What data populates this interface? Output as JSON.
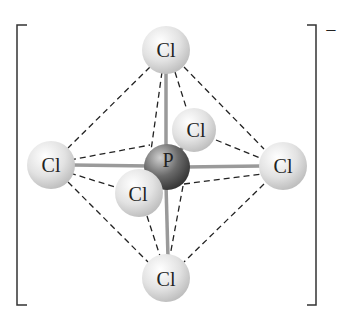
{
  "diagram": {
    "type": "molecular-structure",
    "charge": "−",
    "central_atom": {
      "symbol": "P",
      "x": 167,
      "y": 167
    },
    "ligands": [
      {
        "symbol": "Cl",
        "position": "top",
        "x": 166,
        "y": 50
      },
      {
        "symbol": "Cl",
        "position": "back",
        "x": 194,
        "y": 130
      },
      {
        "symbol": "Cl",
        "position": "left",
        "x": 51,
        "y": 165
      },
      {
        "symbol": "Cl",
        "position": "right",
        "x": 283,
        "y": 166
      },
      {
        "symbol": "Cl",
        "position": "front",
        "x": 139,
        "y": 193
      },
      {
        "symbol": "Cl",
        "position": "bottom",
        "x": 166,
        "y": 278
      }
    ],
    "colors": {
      "chlorine": "#d8d8d8",
      "phosphorus": "#555555",
      "bond": "#aaaaaa",
      "edge": "#222222"
    }
  }
}
